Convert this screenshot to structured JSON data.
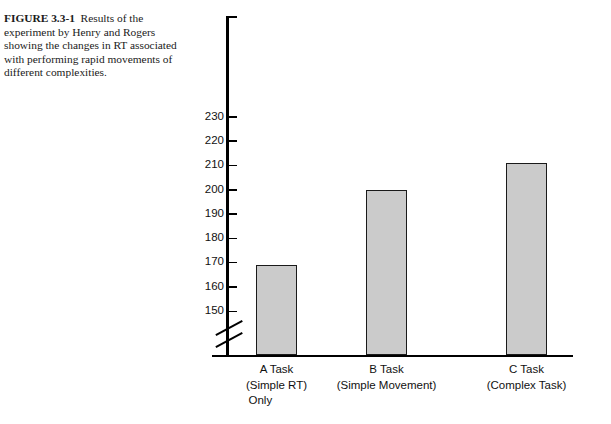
{
  "caption": {
    "figure_label": "FIGURE 3.3-1",
    "text": "Results of the experiment by Henry and Rogers showing the changes in RT associated with performing rapid movements of different complexities."
  },
  "chart_data": {
    "type": "bar",
    "title": "",
    "xlabel": "",
    "ylabel": "",
    "categories": [
      "A Task\n(Simple RT)\nOnly",
      "B Task\n(Simple Movement)",
      "C Task\n(Complex Task)"
    ],
    "category_lines": [
      [
        "A Task",
        "(Simple RT)",
        "Only"
      ],
      [
        "B Task",
        "(Simple Movement)"
      ],
      [
        "C Task",
        "(Complex Task)"
      ]
    ],
    "values": [
      169,
      200,
      211
    ],
    "ylim": [
      150,
      240
    ],
    "yticks": [
      150,
      160,
      170,
      180,
      190,
      200,
      210,
      220,
      230
    ],
    "ytick_labels": [
      "150",
      "160",
      "170",
      "180",
      "190",
      "200",
      "210",
      "220",
      "230"
    ],
    "axis_break": true,
    "grid": false,
    "legend": "none",
    "bar_fill_color": "#cbcbcb",
    "bar_edge_color": "#1a1a1a",
    "axis_color": "#000000"
  }
}
